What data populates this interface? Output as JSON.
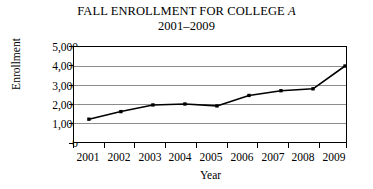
{
  "chart_data": {
    "type": "line",
    "title": "FALL ENROLLMENT FOR COLLEGE A",
    "title_plain": "FALL ENROLLMENT FOR COLLEGE ",
    "title_italic_part": "A",
    "subtitle": "2001–2009",
    "xlabel": "Year",
    "ylabel": "Enrollment",
    "categories": [
      "2001",
      "2002",
      "2003",
      "2004",
      "2005",
      "2006",
      "2007",
      "2008",
      "2009"
    ],
    "values": [
      1200,
      1600,
      1950,
      2000,
      1900,
      2450,
      2700,
      2800,
      4000
    ],
    "ylim": [
      0,
      5000
    ],
    "ytick_labels": [
      "0",
      "1,000",
      "2,000",
      "3,000",
      "4,000",
      "5,000"
    ],
    "ytick_values": [
      0,
      1000,
      2000,
      3000,
      4000,
      5000
    ],
    "grid": "horizontal",
    "legend": "none",
    "marker": "square",
    "line_color": "#000000",
    "marker_color": "#000000",
    "grid_color": "#808080",
    "frame_color": "#000000",
    "background_color": "#ffffff"
  }
}
